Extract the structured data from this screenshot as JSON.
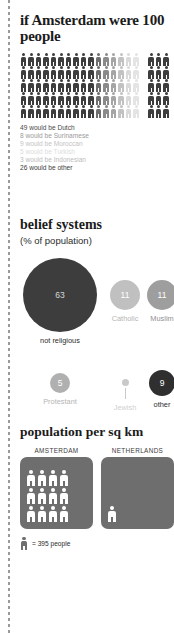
{
  "sections": {
    "demographics": {
      "title": "if Amsterdam were 100 people",
      "total_people": 100,
      "figures_per_row": 20,
      "rows": 5,
      "legend": [
        {
          "text": "49 would be Dutch",
          "value": 49,
          "group": "Dutch",
          "color": "#4a4a4a"
        },
        {
          "text": "8 would be Surinamese",
          "value": 8,
          "group": "Surinamese",
          "color": "#9a9a9a"
        },
        {
          "text": "9 would be Moroccan",
          "value": 9,
          "group": "Moroccan",
          "color": "#c4c4c4"
        },
        {
          "text": "5 would be Turkish",
          "value": 5,
          "group": "Turkish",
          "color": "#dcdcdc"
        },
        {
          "text": "3 would be Indonesian",
          "value": 3,
          "group": "Indonesian",
          "color": "#bdbdbd"
        },
        {
          "text": "26 would be other",
          "value": 26,
          "group": "other",
          "color": "#3d3d3d"
        }
      ],
      "icon_colors": [
        "#3d3d3d",
        "#3d3d3d",
        "#3d3d3d",
        "#3d3d3d",
        "#3d3d3d",
        "#3d3d3d",
        "#3d3d3d",
        "#3d3d3d",
        "#3d3d3d",
        "#3d3d3d",
        "#6e6e6e",
        "#8a8a8a",
        "#a5a5a5",
        "#c2c2c2",
        "#dadada",
        "#e4e4e4",
        "#ffffff",
        "#3d3d3d",
        "#3d3d3d",
        "#3d3d3d"
      ]
    },
    "belief": {
      "title": "belief systems",
      "subtitle": "(% of population)",
      "items": [
        {
          "label": "not religious",
          "value": "63",
          "size": 74,
          "color": "#3d3d3d",
          "label_color": "#2b2b2b",
          "value_color": "#d8d8d8",
          "show_value": true,
          "leader": false
        },
        {
          "label": "Catholic",
          "value": "11",
          "size": 30,
          "color": "#c0c0c0",
          "label_color": "#b5b5b5",
          "value_color": "#ffffff",
          "show_value": true,
          "leader": false
        },
        {
          "label": "Muslim",
          "value": "11",
          "size": 30,
          "color": "#9e9e9e",
          "label_color": "#8f8f8f",
          "value_color": "#ffffff",
          "show_value": true,
          "leader": false
        },
        {
          "label": "Protestant",
          "value": "5",
          "size": 20,
          "color": "#b0b0b0",
          "label_color": "#b5b5b5",
          "value_color": "#ffffff",
          "show_value": true,
          "leader": false
        },
        {
          "label": "Jewish",
          "value": "",
          "size": 7,
          "color": "#c9c9c9",
          "label_color": "#cfcfcf",
          "value_color": "#ffffff",
          "show_value": false,
          "leader": true
        },
        {
          "label": "other",
          "value": "9",
          "size": 26,
          "color": "#2f2f2f",
          "label_color": "#2b2b2b",
          "value_color": "#ffffff",
          "show_value": true,
          "leader": false
        }
      ]
    },
    "density": {
      "title": "population per sq km",
      "panels": [
        {
          "name": "AMSTERDAM",
          "figures": 12
        },
        {
          "name": "NETHERLANDS",
          "figures": 1
        }
      ],
      "footnote": "= 395 people",
      "unit_value": 395
    }
  }
}
